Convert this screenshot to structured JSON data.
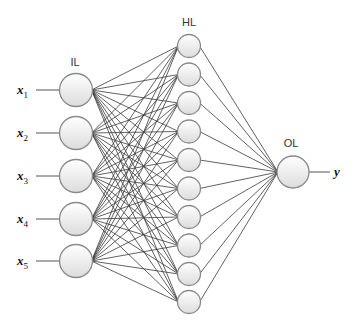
{
  "diagram": {
    "type": "feedforward-neural-network",
    "layers": [
      {
        "id": "input",
        "label": "IL",
        "label_pos": [
          75,
          66
        ],
        "x": 76,
        "radius": 16.5,
        "node_y": [
          90,
          133,
          176,
          219,
          261
        ],
        "inputs": [
          {
            "var": "x",
            "sub": "1",
            "label_x": 17,
            "line_x1": 36
          },
          {
            "var": "x",
            "sub": "2",
            "label_x": 17,
            "line_x1": 36
          },
          {
            "var": "x",
            "sub": "3",
            "label_x": 17,
            "line_x1": 36
          },
          {
            "var": "x",
            "sub": "4",
            "label_x": 17,
            "line_x1": 36
          },
          {
            "var": "x",
            "sub": "5",
            "label_x": 17,
            "line_x1": 36
          }
        ]
      },
      {
        "id": "hidden",
        "label": "HL",
        "label_pos": [
          189,
          26
        ],
        "x": 189,
        "radius": 11.5,
        "node_y": [
          46,
          74.5,
          103,
          131.5,
          160,
          188.5,
          217,
          245.5,
          274,
          302
        ]
      },
      {
        "id": "output",
        "label": "OL",
        "label_pos": [
          291,
          147
        ],
        "x": 293,
        "radius": 16,
        "node_y": [
          172
        ],
        "output": {
          "var": "y",
          "label_x": 334,
          "line_x2": 330
        }
      }
    ],
    "connectivity": "fully-connected",
    "colors": {
      "edge": "#3a3a3a",
      "node_stroke": "#8a8a8a",
      "node_fill_top": "#ffffff",
      "node_fill_bottom": "#dcdcdc",
      "background": "#ffffff"
    }
  }
}
